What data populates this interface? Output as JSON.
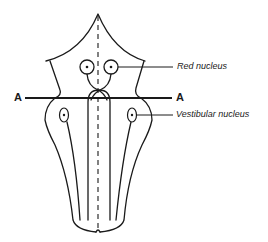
{
  "diagram": {
    "type": "anatomical cross-section schematic (brainstem)",
    "colors": {
      "line": "#1a1a1a",
      "background": "#ffffff"
    },
    "labels": {
      "red_nucleus": "Red nucleus",
      "vestibular_nucleus": "Vestibular nucleus",
      "section_left": "A",
      "section_right": "A"
    },
    "structures": [
      {
        "name": "red-nucleus-left",
        "shape": "circle with center dot"
      },
      {
        "name": "red-nucleus-right",
        "shape": "circle with center dot"
      },
      {
        "name": "vestibular-nucleus-left",
        "shape": "oval with center dot"
      },
      {
        "name": "vestibular-nucleus-right",
        "shape": "oval with center dot"
      },
      {
        "name": "midline",
        "shape": "dashed vertical line"
      },
      {
        "name": "section-line-A-A",
        "shape": "horizontal line"
      }
    ]
  }
}
